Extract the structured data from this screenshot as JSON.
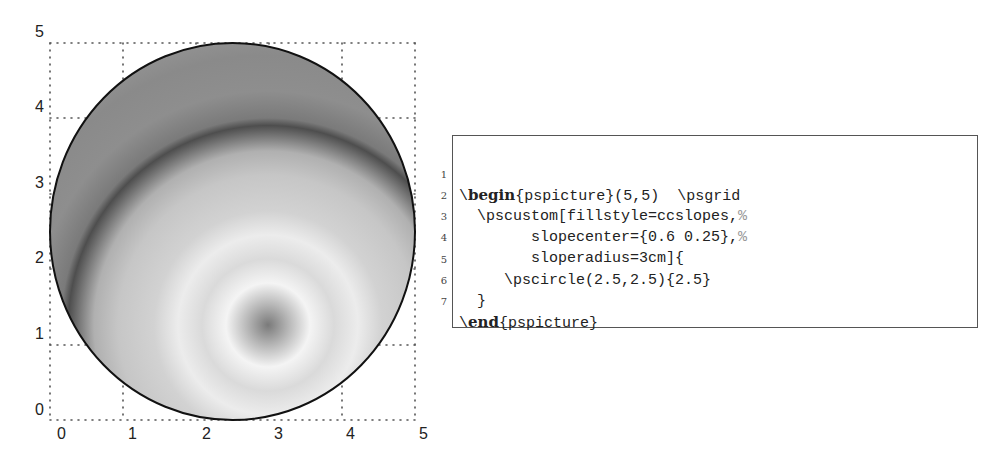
{
  "figure": {
    "x_ticks": [
      "0",
      "1",
      "2",
      "3",
      "4",
      "5"
    ],
    "y_ticks": [
      "0",
      "1",
      "2",
      "3",
      "4",
      "5"
    ],
    "grid": {
      "xmin": 0,
      "xmax": 5,
      "ymin": 0,
      "ymax": 5,
      "style": "dotted"
    },
    "circle": {
      "center": [
        2.5,
        2.5
      ],
      "radius": 2.5,
      "fillstyle": "ccslopes",
      "slopecenter": [
        0.6,
        0.25
      ],
      "sloperadius": "3cm"
    },
    "colors": {
      "grid": "#555555",
      "outline": "#111111",
      "shade_dark": "#6e6e6e",
      "shade_light": "#f2f2f2"
    }
  },
  "code": {
    "lines": [
      {
        "num": "1",
        "prefix": "\\",
        "keyword": "begin",
        "text": "{pspicture}(5,5)  \\psgrid",
        "comment": ""
      },
      {
        "num": "2",
        "prefix": "",
        "keyword": "",
        "text": "  \\pscustom[fillstyle=ccslopes,",
        "comment": "%"
      },
      {
        "num": "3",
        "prefix": "",
        "keyword": "",
        "text": "        slopecenter={0.6 0.25},",
        "comment": "%"
      },
      {
        "num": "4",
        "prefix": "",
        "keyword": "",
        "text": "        sloperadius=3cm]{",
        "comment": ""
      },
      {
        "num": "5",
        "prefix": "",
        "keyword": "",
        "text": "     \\pscircle(2.5,2.5){2.5}",
        "comment": ""
      },
      {
        "num": "6",
        "prefix": "",
        "keyword": "",
        "text": "  }",
        "comment": ""
      },
      {
        "num": "7",
        "prefix": "\\",
        "keyword": "end",
        "text": "{pspicture}",
        "comment": ""
      }
    ]
  }
}
